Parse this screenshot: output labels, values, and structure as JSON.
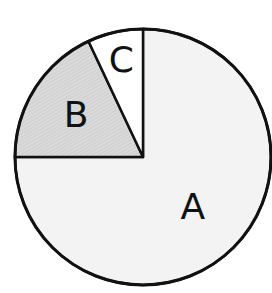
{
  "chart_data": {
    "type": "pie",
    "title": "",
    "start": "top",
    "direction": "counterclockwise-from-A",
    "slices": [
      {
        "label": "A",
        "value": 75,
        "fill": "#f3f3f3",
        "pattern": "none"
      },
      {
        "label": "B",
        "value": 18,
        "fill": "#d9d9d9",
        "pattern": "fine-hatch"
      },
      {
        "label": "C",
        "value": 7,
        "fill": "#ffffff",
        "pattern": "none"
      }
    ],
    "legend": "none",
    "outline_color": "#111111"
  }
}
